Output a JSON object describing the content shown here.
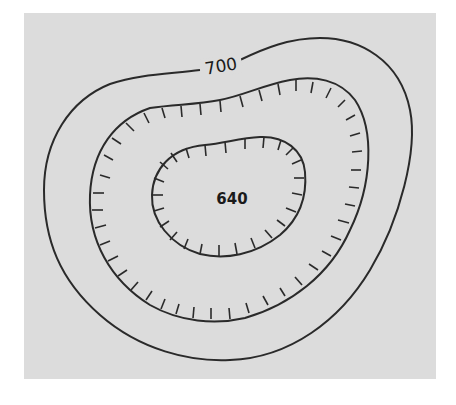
{
  "diagram": {
    "type": "topographic-contour-map",
    "background_color": "#dcdcdc",
    "line_color": "#2a2a2a",
    "contours": [
      {
        "id": "outer",
        "label": "700",
        "hachured": false
      },
      {
        "id": "middle",
        "label": "",
        "hachured": true
      },
      {
        "id": "inner",
        "label": "",
        "hachured": true
      }
    ],
    "center_label": "640"
  }
}
